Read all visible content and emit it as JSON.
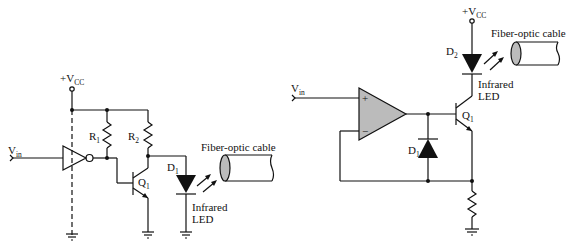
{
  "left_circuit": {
    "vcc_label": "+V",
    "vcc_sub": "CC",
    "vin_label": "V",
    "vin_sub": "in",
    "r1_label": "R",
    "r1_sub": "1",
    "r2_label": "R",
    "r2_sub": "2",
    "q1_label": "Q",
    "q1_sub": "1",
    "d1_label": "D",
    "d1_sub": "1",
    "led_line1": "Infrared",
    "led_line2": "LED",
    "cable_label": "Fiber-optic cable"
  },
  "right_circuit": {
    "vcc_label": "+V",
    "vcc_sub": "CC",
    "vin_label": "V",
    "vin_sub": "in",
    "d2_label": "D",
    "d2_sub": "2",
    "d1_label": "D",
    "d1_sub": "1",
    "q1_label": "Q",
    "q1_sub": "1",
    "led_line1": "Infrared",
    "led_line2": "LED",
    "cable_label": "Fiber-optic cable",
    "opamp_plus": "+",
    "opamp_minus": "−"
  },
  "colors": {
    "line": "#111111",
    "fill_gray": "#bbbbbb"
  }
}
